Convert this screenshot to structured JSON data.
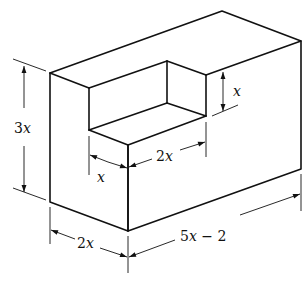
{
  "figure": {
    "labels": {
      "height": "3x",
      "notch_depth": "x",
      "notch_width": "x",
      "notch_length": "2x",
      "block_width": "2x",
      "block_length": "5x − 2"
    }
  }
}
